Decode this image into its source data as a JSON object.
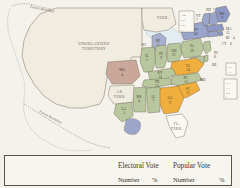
{
  "map": {
    "territories": [
      {
        "name": "UNORGANIZED TERRITORY",
        "line1": "UNORGANIZED",
        "line2": "TERRITORY"
      },
      {
        "name": "AR TERR.",
        "line1": "AR.",
        "line2": "TERR."
      },
      {
        "name": "FL TERR.",
        "line1": "FL.",
        "line2": "TERR."
      },
      {
        "name": "MI TERR.",
        "line1": "MI",
        "line2": "TERR."
      }
    ],
    "boundary_labels": [
      "Future Boundary",
      "Future Boundary"
    ],
    "states": [
      {
        "abbr": "ME",
        "votes": "9"
      },
      {
        "abbr": "NH",
        "votes": "7"
      },
      {
        "abbr": "VT",
        "votes": "7"
      },
      {
        "abbr": "MA",
        "votes": "15"
      },
      {
        "abbr": "RI",
        "votes": "4"
      },
      {
        "abbr": "CT",
        "votes": "8"
      },
      {
        "abbr": "NY",
        "votes": "42"
      },
      {
        "abbr": "NJ",
        "votes": "8"
      },
      {
        "abbr": "PA",
        "votes": "28"
      },
      {
        "abbr": "DE",
        "votes": "3"
      },
      {
        "abbr": "MD",
        "votes": "10"
      },
      {
        "abbr": "VA",
        "votes": "24"
      },
      {
        "abbr": "NC",
        "votes": "15"
      },
      {
        "abbr": "SC",
        "votes": "11"
      },
      {
        "abbr": "GA",
        "votes": "9"
      },
      {
        "abbr": "AL",
        "votes": "7"
      },
      {
        "abbr": "MS",
        "votes": "4"
      },
      {
        "abbr": "LA",
        "votes": "5"
      },
      {
        "abbr": "TN",
        "votes": "15"
      },
      {
        "abbr": "KY",
        "votes": "14"
      },
      {
        "abbr": "OH",
        "votes": "21"
      },
      {
        "abbr": "IN",
        "votes": "9"
      },
      {
        "abbr": "IL",
        "votes": "5"
      },
      {
        "abbr": "MO",
        "votes": "4"
      },
      {
        "abbr": "MI",
        "votes": "3"
      }
    ],
    "inset_boxes": [
      {
        "name": "northeast-inset",
        "rows": [
          "A 26",
          "C 8",
          "C 4",
          "11"
        ]
      },
      {
        "name": "delaware-inset",
        "rows": [
          "C 3",
          "A 1"
        ]
      },
      {
        "name": "maryland-inset",
        "rows": [
          "C 7",
          "A 3",
          "C 2",
          "1"
        ]
      }
    ]
  },
  "results_table": {
    "headers": {
      "electoral_vote": "Electoral Vote",
      "popular_vote": "Popular Vote"
    },
    "subheaders": {
      "electoral_number": "Number",
      "electoral_percent": "%",
      "popular_number": "Number",
      "popular_percent": "%"
    }
  },
  "colors": {
    "paper": "#f3f1ea",
    "unorganized": "#f0ece0",
    "green_state": "#b8c79e",
    "orange_state": "#f0ae3c",
    "blue_state": "#98a2c9",
    "pink_state": "#c9a89a",
    "ink": "#4a3f33"
  }
}
